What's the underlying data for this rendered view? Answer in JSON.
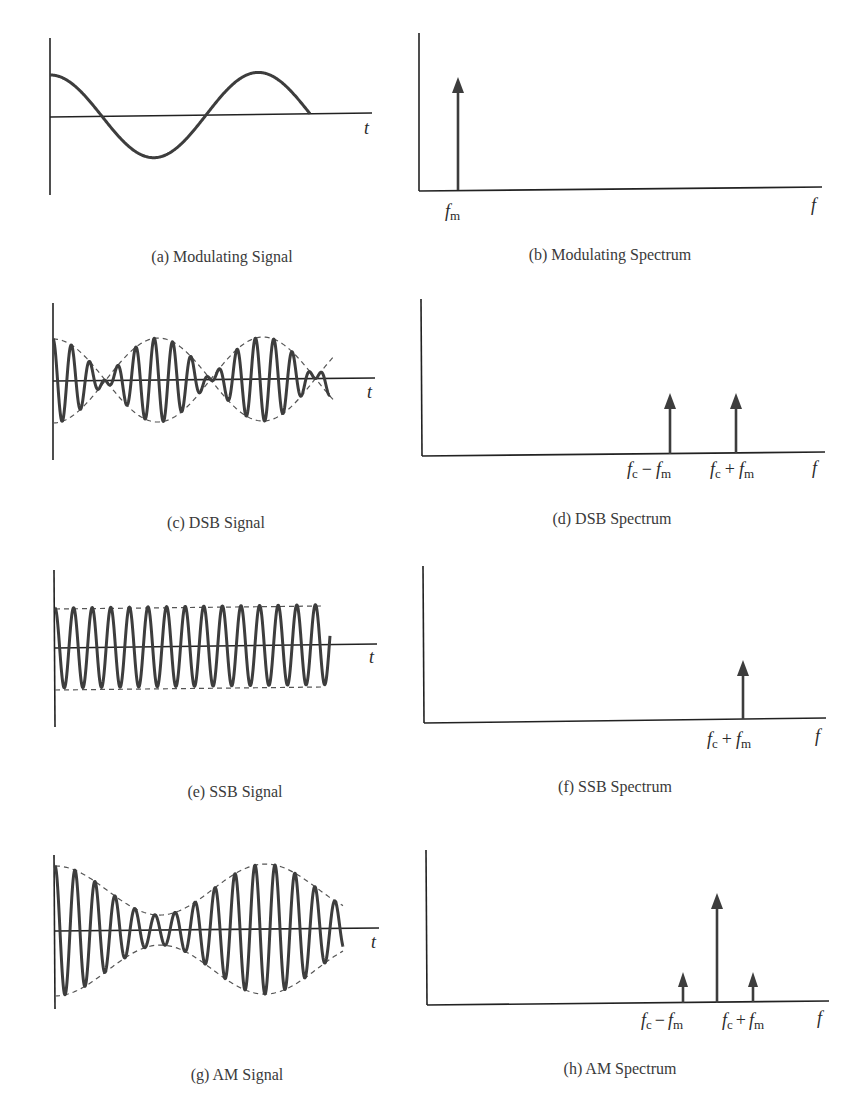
{
  "figure": {
    "panels": [
      {
        "id": "a",
        "caption": "(a) Modulating Signal",
        "kind": "time",
        "x_label": "t"
      },
      {
        "id": "b",
        "caption": "(b) Modulating Spectrum",
        "kind": "spectrum",
        "x_label": "f",
        "lines": [
          {
            "label_main": "f",
            "label_sub": "m",
            "position": "fm",
            "height": "full"
          }
        ]
      },
      {
        "id": "c",
        "caption": "(c) DSB Signal",
        "kind": "time",
        "x_label": "t"
      },
      {
        "id": "d",
        "caption": "(d) DSB Spectrum",
        "kind": "spectrum",
        "x_label": "f",
        "lines": [
          {
            "label": "fc − fm",
            "position": "fc-fm",
            "height": "medium"
          },
          {
            "label": "fc + fm",
            "position": "fc+fm",
            "height": "medium"
          }
        ]
      },
      {
        "id": "e",
        "caption": "(e) SSB Signal",
        "kind": "time",
        "x_label": "t"
      },
      {
        "id": "f",
        "caption": "(f) SSB Spectrum",
        "kind": "spectrum",
        "x_label": "f",
        "lines": [
          {
            "label": "fc + fm",
            "position": "fc+fm",
            "height": "medium"
          }
        ]
      },
      {
        "id": "g",
        "caption": "(g) AM Signal",
        "kind": "time",
        "x_label": "t"
      },
      {
        "id": "h",
        "caption": "(h) AM Spectrum",
        "kind": "spectrum",
        "x_label": "f",
        "lines": [
          {
            "label": "fc − fm",
            "position": "fc-fm",
            "height": "small"
          },
          {
            "label": "fc",
            "position": "fc",
            "height": "large",
            "unlabeled": true
          },
          {
            "label": "fc + fm",
            "position": "fc+fm",
            "height": "small"
          }
        ]
      }
    ],
    "labels": {
      "t": "t",
      "f": "f",
      "f_main": "f",
      "sub_m": "m",
      "sub_c": "c",
      "minus": "−",
      "plus": "+"
    },
    "colors": {
      "signal": "#3d3d3d",
      "axis": "#222222",
      "envelope": "#555555",
      "caption": "#3a3a3a"
    }
  },
  "chart_data": [
    {
      "type": "line",
      "title": "(a) Modulating Signal",
      "xlabel": "t",
      "ylabel": "",
      "description": "Cosine modulating signal, about 1.25 cycles",
      "series": [
        {
          "name": "m(t)",
          "shape": "cos",
          "cycles": 1.25
        }
      ]
    },
    {
      "type": "bar",
      "title": "(b) Modulating Spectrum",
      "xlabel": "f",
      "ylabel": "",
      "categories": [
        "fm"
      ],
      "values": [
        1.0
      ]
    },
    {
      "type": "line",
      "title": "(c) DSB Signal",
      "xlabel": "t",
      "ylabel": "",
      "description": "Carrier multiplied by modulating signal; dashed envelope ±|m(t)| with phase reversals at zeros",
      "series": [
        {
          "name": "s_DSB(t)",
          "carrier_cycles": 15
        }
      ]
    },
    {
      "type": "bar",
      "title": "(d) DSB Spectrum",
      "xlabel": "f",
      "ylabel": "",
      "categories": [
        "fc − fm",
        "fc + fm"
      ],
      "values": [
        0.5,
        0.5
      ]
    },
    {
      "type": "line",
      "title": "(e) SSB Signal",
      "xlabel": "t",
      "ylabel": "",
      "description": "Constant-amplitude sinusoid at fc + fm with flat dashed envelope",
      "series": [
        {
          "name": "s_SSB(t)",
          "carrier_cycles": 15
        }
      ]
    },
    {
      "type": "bar",
      "title": "(f) SSB Spectrum",
      "xlabel": "f",
      "ylabel": "",
      "categories": [
        "fc + fm"
      ],
      "values": [
        0.5
      ]
    },
    {
      "type": "line",
      "title": "(g) AM Signal",
      "xlabel": "t",
      "ylabel": "",
      "description": "Carrier with envelope 1 + k·m(t), never crossing zero",
      "series": [
        {
          "name": "s_AM(t)",
          "carrier_cycles": 15
        }
      ]
    },
    {
      "type": "bar",
      "title": "(h) AM Spectrum",
      "xlabel": "f",
      "ylabel": "",
      "categories": [
        "fc − fm",
        "fc",
        "fc + fm"
      ],
      "values": [
        0.28,
        1.0,
        0.28
      ]
    }
  ]
}
